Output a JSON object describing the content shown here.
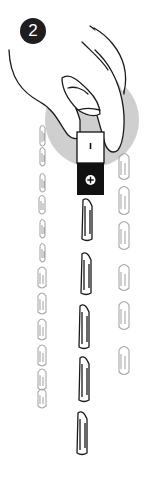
{
  "illustration": {
    "step_number": "2",
    "magnet": {
      "top_pole_symbol": "−",
      "bottom_pole_symbol": "+",
      "top_color": "#ffffff",
      "bottom_color": "#111111"
    },
    "colors": {
      "halo": "#cfcfcf",
      "outline": "#1a1a1a",
      "faded_clip": "#a8a8a8",
      "badge": "#1e1e1e"
    },
    "chains": {
      "center_clip_count": 6,
      "left_clip_count": 12,
      "right_clip_count": 7
    }
  }
}
